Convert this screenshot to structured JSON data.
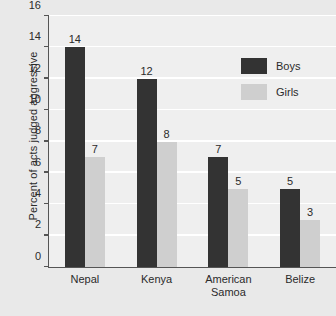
{
  "chart_data": {
    "type": "bar",
    "title": "",
    "xlabel": "",
    "ylabel": "Percent of acts judged aggressive",
    "categories": [
      "Nepal",
      "Kenya",
      "American Samoa",
      "Belize"
    ],
    "series": [
      {
        "name": "Boys",
        "values": [
          14,
          12,
          7,
          5
        ],
        "color": "#333333"
      },
      {
        "name": "Girls",
        "values": [
          7,
          8,
          5,
          3
        ],
        "color": "#cfcfcf"
      }
    ],
    "ylim": [
      0,
      16
    ],
    "ytick_step": 2,
    "yticks": [
      0,
      2,
      4,
      6,
      8,
      10,
      12,
      14,
      16
    ],
    "ytick_labels": [
      "0",
      "2",
      "4",
      "6",
      "8",
      "10",
      "12",
      "14",
      "16"
    ],
    "grid": true,
    "grid_color": "#ffffff",
    "legend_position": "top-right",
    "plot_background": "#efefef",
    "figure_background": "#e9e9e9",
    "axis_color": "#555555",
    "data_labels": true
  },
  "category_lines": [
    [
      "Nepal"
    ],
    [
      "Kenya"
    ],
    [
      "American",
      "Samoa"
    ],
    [
      "Belize"
    ]
  ],
  "legend": {
    "items": [
      {
        "label": "Boys"
      },
      {
        "label": "Girls"
      }
    ]
  }
}
